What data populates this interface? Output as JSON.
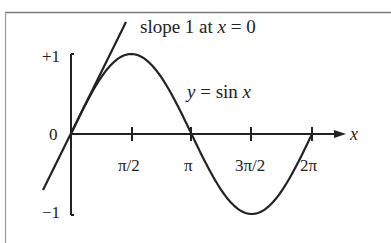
{
  "chart_data": {
    "type": "line",
    "title": "",
    "curve_label": "y = sin x",
    "annotation": "slope 1 at x = 0",
    "xlabel": "x",
    "ylabel": "",
    "x_ticks": [
      "π/2",
      "π",
      "3π/2",
      "2π"
    ],
    "x_tick_values": [
      1.5708,
      3.1416,
      4.7124,
      6.2832
    ],
    "y_ticks": [
      "+1",
      "0",
      "−1"
    ],
    "y_tick_values": [
      1,
      0,
      -1
    ],
    "xlim": [
      0,
      6.2832
    ],
    "ylim": [
      -1,
      1
    ],
    "series": [
      {
        "name": "y = sin x",
        "function": "sin(x)",
        "x_range": [
          0,
          6.2832
        ]
      },
      {
        "name": "tangent at x = 0",
        "function": "x",
        "slope": 1,
        "x_range": [
          -0.73,
          1.38
        ]
      }
    ],
    "key_points": [
      {
        "x": 0,
        "y": 0
      },
      {
        "x": 1.5708,
        "y": 1
      },
      {
        "x": 3.1416,
        "y": 0
      },
      {
        "x": 4.7124,
        "y": -1
      },
      {
        "x": 6.2832,
        "y": 0
      }
    ]
  },
  "labels": {
    "annotation_prefix": "slope 1 at ",
    "annotation_var": "x",
    "annotation_suffix": " = 0",
    "curve_y": "y",
    "curve_eq": " = sin ",
    "curve_x": "x",
    "axis_x": "x",
    "y_plus": "+1",
    "y_zero": "0",
    "y_minus": "−1",
    "t1": "π/2",
    "t2": "π",
    "t3": "3π/2",
    "t4": "2π"
  }
}
